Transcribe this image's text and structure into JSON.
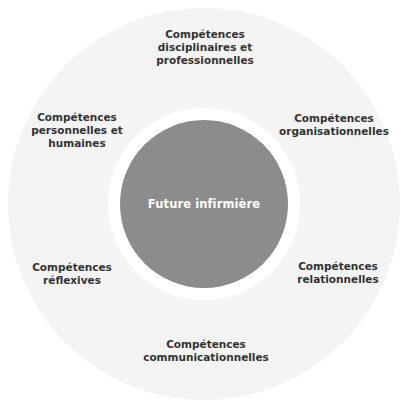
{
  "diagram": {
    "center": {
      "label": "Future infirmière",
      "color": "#8c8c8c"
    },
    "ring_color": "#f3f3f3",
    "label_color": "#333333",
    "competencies": [
      {
        "position": "top",
        "label": "Compétences\ndisciplinaires et\nprofessionnelles"
      },
      {
        "position": "top-right",
        "label": "Compétences\norganisationnelles"
      },
      {
        "position": "bottom-right",
        "label": "Compétences\nrelationnelles"
      },
      {
        "position": "bottom",
        "label": "Compétences\ncommunicationnelles"
      },
      {
        "position": "bottom-left",
        "label": "Compétences\nréflexives"
      },
      {
        "position": "top-left",
        "label": "Compétences\npersonnelles et\nhumaines"
      }
    ]
  }
}
